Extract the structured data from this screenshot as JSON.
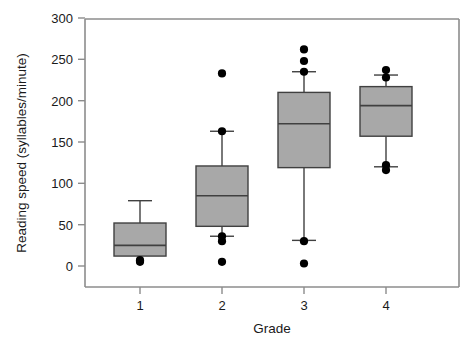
{
  "chart_data": {
    "type": "box",
    "title": "",
    "xlabel": "Grade",
    "ylabel": "Reading speed (syllables/minute)",
    "categories": [
      "1",
      "2",
      "3",
      "4"
    ],
    "xtick_labels": [
      "1",
      "2",
      "3",
      "4"
    ],
    "ytick_labels": [
      "0",
      "50",
      "100",
      "150",
      "200",
      "250",
      "300"
    ],
    "yticks": [
      0,
      50,
      100,
      150,
      200,
      250,
      300
    ],
    "ylim": [
      0,
      300
    ],
    "grid": false,
    "legend": null,
    "box_fill_color": "#a8a8a8",
    "box_edge_color": "#404040",
    "outlier_color": "#000000",
    "axis_color": "#808080",
    "boxes": [
      {
        "category": "1",
        "q1": 12,
        "median": 25,
        "q3": 52,
        "whisker_low": 12,
        "whisker_high": 79,
        "outliers": [
          7,
          5
        ]
      },
      {
        "category": "2",
        "q1": 48,
        "median": 85,
        "q3": 121,
        "whisker_low": 36,
        "whisker_high": 163,
        "outliers": [
          233,
          163,
          36,
          30,
          5
        ]
      },
      {
        "category": "3",
        "q1": 119,
        "median": 172,
        "q3": 210,
        "whisker_low": 31,
        "whisker_high": 235,
        "outliers": [
          262,
          248,
          235,
          30,
          3
        ]
      },
      {
        "category": "4",
        "q1": 157,
        "median": 194,
        "q3": 217,
        "whisker_low": 120,
        "whisker_high": 231,
        "outliers": [
          237,
          228,
          122,
          116
        ]
      }
    ]
  },
  "axes": {
    "x_axis_title": "Grade",
    "y_axis_title": "Reading speed (syllables/minute)"
  }
}
